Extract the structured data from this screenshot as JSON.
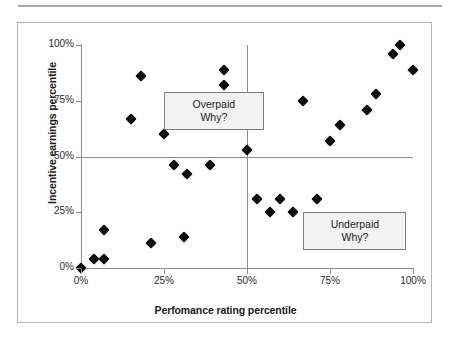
{
  "chart_data": {
    "type": "scatter",
    "title": "",
    "xlabel": "Perfomance rating percentile",
    "ylabel": "Incentive earnings percentile",
    "xlim": [
      0,
      100
    ],
    "ylim": [
      0,
      100
    ],
    "xticks": [
      "0%",
      "25%",
      "50%",
      "75%",
      "100%"
    ],
    "yticks": [
      "0%",
      "25%",
      "50%",
      "75%",
      "100%"
    ],
    "xtick_values": [
      0,
      25,
      50,
      75,
      100
    ],
    "ytick_values": [
      0,
      25,
      50,
      75,
      100
    ],
    "grid": false,
    "legend": "none",
    "reference_lines": {
      "horizontal": 50,
      "vertical": 50
    },
    "series": [
      {
        "name": "Employees",
        "marker": "diamond",
        "color": "#0d0d0d",
        "points": [
          [
            0,
            0
          ],
          [
            4,
            4
          ],
          [
            7,
            4
          ],
          [
            7,
            17
          ],
          [
            15,
            67
          ],
          [
            18,
            86
          ],
          [
            21,
            11
          ],
          [
            25,
            60
          ],
          [
            28,
            46
          ],
          [
            31,
            14
          ],
          [
            32,
            42
          ],
          [
            39,
            46
          ],
          [
            43,
            89
          ],
          [
            43,
            82
          ],
          [
            50,
            53
          ],
          [
            53,
            31
          ],
          [
            57,
            25
          ],
          [
            60,
            31
          ],
          [
            64,
            25
          ],
          [
            67,
            75
          ],
          [
            71,
            31
          ],
          [
            75,
            57
          ],
          [
            78,
            64
          ],
          [
            82,
            21
          ],
          [
            86,
            71
          ],
          [
            89,
            78
          ],
          [
            94,
            96
          ],
          [
            96,
            100
          ],
          [
            100,
            89
          ]
        ]
      }
    ],
    "annotations": [
      {
        "id": "overpaid",
        "lines": [
          "Overpaid",
          "Why?"
        ],
        "quadrant": "upper-left",
        "x_range": [
          25,
          55
        ],
        "y_range": [
          62,
          79
        ]
      },
      {
        "id": "underpaid",
        "lines": [
          "Underpaid",
          "Why?"
        ],
        "quadrant": "lower-right",
        "x_range": [
          67,
          98
        ],
        "y_range": [
          8,
          25
        ]
      }
    ]
  },
  "colors": {
    "marker": "#0d0d0d",
    "axis": "#8c8c8c",
    "frame": "#b4b4b4",
    "callout_fill": "#f2f2f2",
    "callout_border": "#7d7d7d",
    "text": "#1a1a1a"
  }
}
